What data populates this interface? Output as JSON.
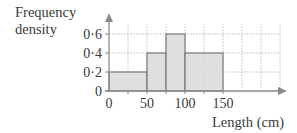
{
  "chart_data": {
    "type": "bar",
    "subtype": "histogram",
    "title": "",
    "xlabel": "Length (cm)",
    "ylabel": "Frequency density",
    "x_ticks": [
      "0",
      "50",
      "100",
      "150"
    ],
    "y_ticks": [
      "0",
      "0·2",
      "0·4",
      "0·6"
    ],
    "bins": [
      {
        "from": 0,
        "to": 50,
        "frequency_density": 0.2
      },
      {
        "from": 50,
        "to": 75,
        "frequency_density": 0.4
      },
      {
        "from": 75,
        "to": 100,
        "frequency_density": 0.6
      },
      {
        "from": 100,
        "to": 150,
        "frequency_density": 0.4
      }
    ],
    "categories": [
      "0-50",
      "50-75",
      "75-100",
      "100-150"
    ],
    "values": [
      0.2,
      0.4,
      0.6,
      0.4
    ],
    "xlim": [
      0,
      225
    ],
    "ylim": [
      0,
      0.7
    ],
    "grid": true,
    "legend": null,
    "colors": {
      "bar_fill": "#d9d9d9",
      "bar_edge": "#7a7a7a",
      "axis": "#8a8a8a",
      "grid": "#bdbdbd"
    }
  },
  "labels": {
    "ylabel_line1": "Frequency",
    "ylabel_line2": "density",
    "xlabel": "Length (cm)"
  }
}
